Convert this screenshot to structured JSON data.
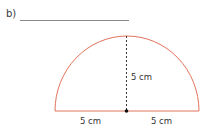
{
  "question": {
    "part_label": "b)",
    "answer_line": ""
  },
  "figure": {
    "shape": "semicircle",
    "stroke_color": "#e0735a",
    "height_label": "5 cm",
    "left_radius_label": "5 cm",
    "right_radius_label": "5 cm"
  }
}
